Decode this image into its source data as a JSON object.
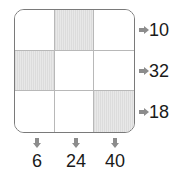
{
  "grid": {
    "rows": 3,
    "cols": 3,
    "shaded": [
      [
        0,
        1
      ],
      [
        1,
        0
      ],
      [
        2,
        2
      ]
    ],
    "shade_color": "#e2e2e2",
    "cells": [
      {
        "row": 0,
        "col": 0,
        "shaded": false
      },
      {
        "row": 0,
        "col": 1,
        "shaded": true
      },
      {
        "row": 0,
        "col": 2,
        "shaded": false
      },
      {
        "row": 1,
        "col": 0,
        "shaded": true
      },
      {
        "row": 1,
        "col": 1,
        "shaded": false
      },
      {
        "row": 1,
        "col": 2,
        "shaded": false
      },
      {
        "row": 2,
        "col": 0,
        "shaded": false
      },
      {
        "row": 2,
        "col": 1,
        "shaded": false
      },
      {
        "row": 2,
        "col": 2,
        "shaded": true
      }
    ]
  },
  "row_clues": [
    {
      "icon": "arrow-right-icon",
      "value": "10"
    },
    {
      "icon": "arrow-right-icon",
      "value": "32"
    },
    {
      "icon": "arrow-right-icon",
      "value": "18"
    }
  ],
  "col_clues": [
    {
      "icon": "arrow-down-icon",
      "value": "6"
    },
    {
      "icon": "arrow-down-icon",
      "value": "24"
    },
    {
      "icon": "arrow-down-icon",
      "value": "40"
    }
  ]
}
